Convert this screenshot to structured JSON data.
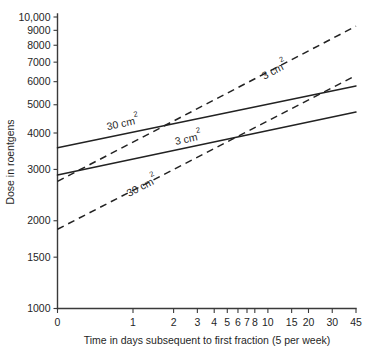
{
  "chart_data": {
    "type": "line",
    "title": "",
    "xlabel": "Time in days subsequent to first fraction (5 per week)",
    "ylabel": "Dose in roentgens",
    "x_scale": "log-shifted",
    "y_scale": "log",
    "grid": false,
    "legend": "inline-labels",
    "xlim": [
      0,
      45
    ],
    "ylim": [
      1000,
      10000
    ],
    "x_ticks": [
      {
        "value": 0,
        "label": "0"
      },
      {
        "value": 1,
        "label": "1"
      },
      {
        "value": 2,
        "label": "2"
      },
      {
        "value": 3,
        "label": "3"
      },
      {
        "value": 4,
        "label": "4"
      },
      {
        "value": 5,
        "label": "5"
      },
      {
        "value": 6,
        "label": "6"
      },
      {
        "value": 7,
        "label": "7"
      },
      {
        "value": 8,
        "label": "8"
      },
      {
        "value": 10,
        "label": "10"
      },
      {
        "value": 15,
        "label": "15"
      },
      {
        "value": 20,
        "label": "20"
      },
      {
        "value": 30,
        "label": "30"
      },
      {
        "value": 45,
        "label": "45"
      }
    ],
    "y_ticks": [
      {
        "value": 1000,
        "label": "1000"
      },
      {
        "value": 1500,
        "label": "1500"
      },
      {
        "value": 2000,
        "label": "2000"
      },
      {
        "value": 3000,
        "label": "3000"
      },
      {
        "value": 4000,
        "label": "4000"
      },
      {
        "value": 5000,
        "label": "5000"
      },
      {
        "value": 6000,
        "label": "6000"
      },
      {
        "value": 7000,
        "label": "7000"
      },
      {
        "value": 8000,
        "label": "8000"
      },
      {
        "value": 9000,
        "label": "9000"
      },
      {
        "value": 10000,
        "label": "10,000"
      }
    ],
    "series": [
      {
        "name": "30 cm2 solid",
        "label_base": "30 cm",
        "label_sup": "2",
        "style": "solid",
        "points": [
          {
            "x": 0,
            "y": 3560
          },
          {
            "x": 45,
            "y": 5800
          }
        ],
        "label_position": {
          "x": 0.85,
          "y": 4200
        }
      },
      {
        "name": "3 cm2 solid",
        "label_base": "3 cm",
        "label_sup": "2",
        "style": "solid",
        "points": [
          {
            "x": 0,
            "y": 2870
          },
          {
            "x": 45,
            "y": 4720
          }
        ],
        "label_position": {
          "x": 2.6,
          "y": 3720
        }
      },
      {
        "name": "3 cm2 dashed",
        "label_base": "3 cm",
        "label_sup": "2",
        "style": "dashed",
        "points": [
          {
            "x": 0,
            "y": 2730
          },
          {
            "x": 45,
            "y": 9300
          }
        ],
        "label_position": {
          "x": 11.5,
          "y": 6400
        }
      },
      {
        "name": "30 cm2 dashed",
        "label_base": "30 cm",
        "label_sup": "2",
        "style": "dashed",
        "points": [
          {
            "x": 0,
            "y": 1870
          },
          {
            "x": 45,
            "y": 6300
          }
        ],
        "label_position": {
          "x": 1.2,
          "y": 2560
        }
      }
    ]
  }
}
